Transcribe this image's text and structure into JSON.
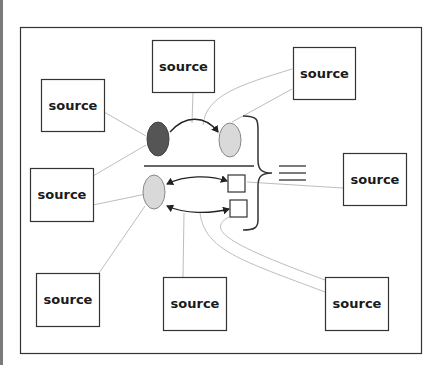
{
  "diagram": {
    "colors": {
      "frame": "#333333",
      "box_border": "#333333",
      "connector": "#bdbdbd",
      "node_dark": "#555555",
      "node_light": "#d9d9d9",
      "arrow": "#222222"
    },
    "sources": [
      {
        "id": "top-center",
        "label": "source"
      },
      {
        "id": "top-right",
        "label": "source"
      },
      {
        "id": "left-top",
        "label": "source"
      },
      {
        "id": "left-middle",
        "label": "source"
      },
      {
        "id": "right-middle",
        "label": "source"
      },
      {
        "id": "bottom-left",
        "label": "source"
      },
      {
        "id": "bottom-center",
        "label": "source"
      },
      {
        "id": "bottom-right",
        "label": "source"
      }
    ],
    "center": {
      "top_row": [
        "dark-ellipse",
        "light-ellipse"
      ],
      "bottom_row": [
        "light-ellipse",
        "small-square",
        "small-square"
      ],
      "brace": "right-curly-brace",
      "equivalence": "triple-bar"
    }
  }
}
